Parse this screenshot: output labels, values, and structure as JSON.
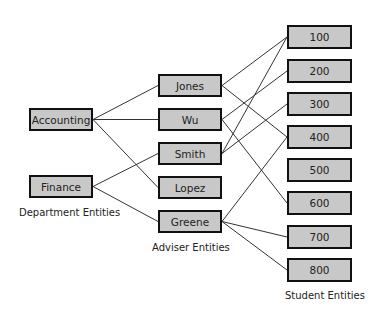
{
  "departments": [
    {
      "id": "accounting",
      "label": "Accounting",
      "x": 29,
      "y": 108,
      "w": 64,
      "h": 23
    },
    {
      "id": "finance",
      "label": "Finance",
      "x": 29,
      "y": 175,
      "w": 64,
      "h": 23
    }
  ],
  "advisers": [
    {
      "id": "jones",
      "label": "Jones",
      "x": 158,
      "y": 74,
      "w": 64,
      "h": 23
    },
    {
      "id": "wu",
      "label": "Wu",
      "x": 158,
      "y": 108,
      "w": 64,
      "h": 23
    },
    {
      "id": "smith",
      "label": "Smith",
      "x": 158,
      "y": 142,
      "w": 64,
      "h": 23
    },
    {
      "id": "lopez",
      "label": "Lopez",
      "x": 158,
      "y": 176,
      "w": 64,
      "h": 23
    },
    {
      "id": "greene",
      "label": "Greene",
      "x": 158,
      "y": 210,
      "w": 64,
      "h": 23
    }
  ],
  "students": [
    {
      "id": "s100",
      "label": "100",
      "x": 287,
      "y": 25,
      "w": 65,
      "h": 24
    },
    {
      "id": "s200",
      "label": "200",
      "x": 287,
      "y": 59,
      "w": 65,
      "h": 24
    },
    {
      "id": "s300",
      "label": "300",
      "x": 287,
      "y": 92,
      "w": 65,
      "h": 24
    },
    {
      "id": "s400",
      "label": "400",
      "x": 287,
      "y": 125,
      "w": 65,
      "h": 24
    },
    {
      "id": "s500",
      "label": "500",
      "x": 287,
      "y": 158,
      "w": 65,
      "h": 24
    },
    {
      "id": "s600",
      "label": "600",
      "x": 287,
      "y": 191,
      "w": 65,
      "h": 24
    },
    {
      "id": "s700",
      "label": "700",
      "x": 287,
      "y": 225,
      "w": 65,
      "h": 24
    },
    {
      "id": "s800",
      "label": "800",
      "x": 287,
      "y": 258,
      "w": 65,
      "h": 24
    }
  ],
  "labels": {
    "departments": "Department Entities",
    "advisers": "Adviser Entities",
    "students": "Student Entities"
  },
  "edges": [
    [
      "accounting",
      "jones"
    ],
    [
      "accounting",
      "wu"
    ],
    [
      "accounting",
      "lopez"
    ],
    [
      "finance",
      "smith"
    ],
    [
      "finance",
      "greene"
    ],
    [
      "jones",
      "s100"
    ],
    [
      "jones",
      "s400"
    ],
    [
      "wu",
      "s200"
    ],
    [
      "wu",
      "s600"
    ],
    [
      "smith",
      "s100"
    ],
    [
      "smith",
      "s300"
    ],
    [
      "greene",
      "s400"
    ],
    [
      "greene",
      "s700"
    ],
    [
      "greene",
      "s800"
    ]
  ],
  "colors": {
    "box_fill": "#c8c8c8",
    "box_border": "#111111",
    "line": "#333333"
  }
}
